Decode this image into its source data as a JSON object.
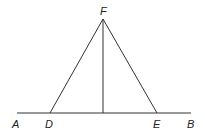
{
  "diagram": {
    "type": "geometry",
    "labels": {
      "A": "A",
      "B": "B",
      "D": "D",
      "E": "E",
      "F": "F"
    },
    "points": {
      "A": [
        17,
        113
      ],
      "B": [
        191,
        113
      ],
      "D": [
        50,
        113
      ],
      "E": [
        157,
        113
      ],
      "F": [
        103,
        19
      ],
      "foot": [
        103,
        113
      ]
    },
    "segments": [
      [
        "A",
        "B"
      ],
      [
        "F",
        "D"
      ],
      [
        "F",
        "E"
      ],
      [
        "F",
        "foot"
      ]
    ],
    "colors": {
      "stroke": "#333333",
      "text": "#222222"
    }
  }
}
